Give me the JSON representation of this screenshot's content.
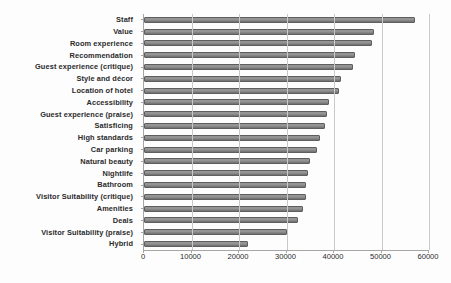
{
  "chart_data": {
    "type": "bar",
    "orientation": "horizontal",
    "title": "",
    "subtitle": "",
    "xlabel": "",
    "ylabel": "",
    "grid": true,
    "legend": false,
    "xlim": [
      0,
      60000
    ],
    "xticks": [
      "0",
      "10000",
      "20000",
      "30000",
      "40000",
      "50000",
      "60000"
    ],
    "xtick_values": [
      0,
      10000,
      20000,
      30000,
      40000,
      50000,
      60000
    ],
    "categories": [
      "Staff",
      "Value",
      "Room experience",
      "Recommendation",
      "Guest experience (critique)",
      "Style and décor",
      "Location of hotel",
      "Accessibility",
      "Guest experience (praise)",
      "Satisficing",
      "High standards",
      "Car parking",
      "Natural beauty",
      "Nightlife",
      "Bathroom",
      "Visitor Suitability (critique)",
      "Amenities",
      "Deals",
      "Visitor Suitability (praise)",
      "Hybrid"
    ],
    "values": [
      57000,
      48500,
      48000,
      44500,
      44000,
      41500,
      41000,
      39000,
      38500,
      38000,
      37000,
      36500,
      35000,
      34500,
      34000,
      34000,
      33500,
      32500,
      30000,
      21800
    ],
    "bar_color": "#8c8c8c",
    "bar_edge_color": "#5e5e5e",
    "grid_color": "#c9c9c9",
    "axis_color": "#a6a6a6",
    "text_color": "#2b2b2b",
    "background": "#ffffff"
  }
}
